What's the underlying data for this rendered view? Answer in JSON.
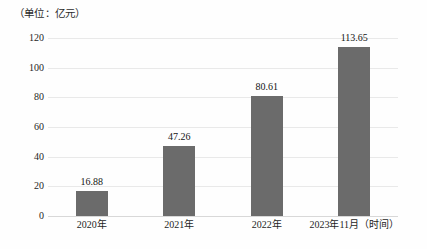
{
  "chart_data": {
    "type": "bar",
    "title": "（单位：亿元）",
    "xlabel": "",
    "ylabel": "",
    "categories": [
      "2020年",
      "2021年",
      "2022年",
      "2023年11月（时间）"
    ],
    "values": [
      16.88,
      47.26,
      80.61,
      113.65
    ],
    "value_labels": [
      "16.88",
      "47.26",
      "80.61",
      "113.65"
    ],
    "ylim": [
      0,
      120
    ],
    "yticks": [
      0,
      20,
      40,
      60,
      80,
      100,
      120
    ],
    "ytick_labels": [
      "0",
      "20",
      "40",
      "60",
      "80",
      "100",
      "120"
    ],
    "grid": true,
    "legend": false,
    "legend_position": "none",
    "bar_color": "#6b6b6b",
    "gridline_color": "#e9e9e9",
    "axis_color": "#d8d8d8",
    "background_color": "#fefefe"
  }
}
